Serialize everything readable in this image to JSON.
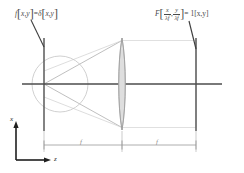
{
  "figure": {
    "name": "fourier-transform-lens-diagram",
    "labels": {
      "input_plane_equation_prefix": "f",
      "input_plane_equation": "f[x,y] = δ[x,y]",
      "output_plane_equation": "F[ x/λf , y/λf ] = 1[x,y]",
      "output_F": "F",
      "output_num_x": "x",
      "output_den_x": "λf",
      "output_sep": ",",
      "output_num_y": "y",
      "output_den_y": "λf",
      "output_tail": "= 1[x,y]",
      "input_f": "f",
      "input_bracket_open": "[",
      "input_args": "x,y",
      "input_bracket_close": "]",
      "input_equals": "=",
      "input_delta": "δ",
      "axis_x": "x",
      "axis_z": "z",
      "focal_left": "f",
      "focal_right": "f"
    },
    "colors": {
      "axis": "#4d4d4d",
      "plane": "#5a5a5a",
      "ray": "#b0b0b0",
      "beam": "#d8d8d8",
      "lens_fill": "#d9d9d9",
      "lens_stroke": "#a8a8a8",
      "circle": "#bdbdbd",
      "dimension": "#9b9b9b",
      "leader": "#3f3f3f",
      "text": "#4a4a4a",
      "background": "#ffffff"
    },
    "geometry": {
      "input_plane_x": 44,
      "lens_x": 122,
      "output_plane_x": 196,
      "optical_axis_y": 84
    }
  }
}
